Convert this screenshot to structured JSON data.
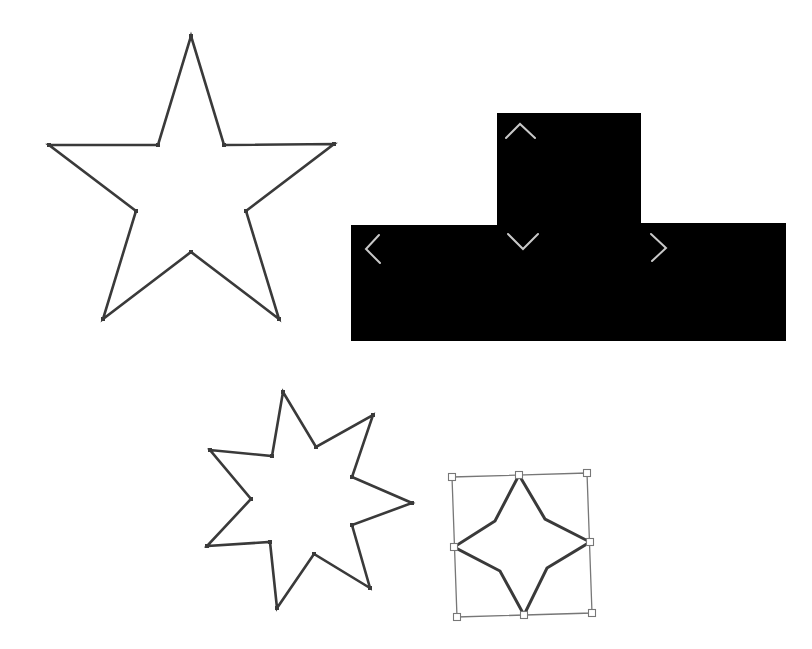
{
  "canvas": {
    "width": 812,
    "height": 649,
    "background": "#ffffff"
  },
  "colors": {
    "outline": "#3a3a3a",
    "fill_black": "#000000",
    "chevron": "#c8c8c8",
    "selection": "#777777"
  },
  "shapes": {
    "star5": {
      "label": "five-point-star",
      "points": [
        [
          191,
          36
        ],
        [
          224,
          145
        ],
        [
          334,
          144
        ],
        [
          246,
          211
        ],
        [
          279,
          319
        ],
        [
          191,
          252
        ],
        [
          103,
          319
        ],
        [
          136,
          211
        ],
        [
          49,
          145
        ],
        [
          158,
          145
        ]
      ]
    },
    "tshape": {
      "label": "black-t-shape",
      "points": [
        [
          497,
          113
        ],
        [
          641,
          113
        ],
        [
          641,
          223
        ],
        [
          786,
          223
        ],
        [
          786,
          341
        ],
        [
          351,
          341
        ],
        [
          351,
          225
        ],
        [
          497,
          225
        ]
      ],
      "chevrons": [
        {
          "name": "chevron-up-icon",
          "path": "M506,138 L520,124 L535,138"
        },
        {
          "name": "chevron-down-icon",
          "path": "M508,234 L523,249 L538,234"
        },
        {
          "name": "chevron-left-icon",
          "path": "M379,235 L366,249 L380,263"
        },
        {
          "name": "chevron-right-icon",
          "path": "M651,234 L666,248 L652,261"
        }
      ]
    },
    "star7": {
      "label": "seven-point-star",
      "points": [
        [
          283,
          392
        ],
        [
          316,
          447
        ],
        [
          373,
          415
        ],
        [
          352,
          477
        ],
        [
          412,
          503
        ],
        [
          352,
          525
        ],
        [
          370,
          588
        ],
        [
          314,
          554
        ],
        [
          277,
          608
        ],
        [
          270,
          542
        ],
        [
          207,
          546
        ],
        [
          251,
          499
        ],
        [
          210,
          450
        ],
        [
          272,
          456
        ]
      ]
    },
    "star4": {
      "label": "four-point-star-selected",
      "points": [
        [
          519,
          475
        ],
        [
          545,
          519
        ],
        [
          590,
          542
        ],
        [
          547,
          568
        ],
        [
          524,
          615
        ],
        [
          500,
          571
        ],
        [
          454,
          547
        ],
        [
          495,
          521
        ]
      ],
      "selection_box": [
        [
          452,
          477
        ],
        [
          587,
          473
        ],
        [
          592,
          613
        ],
        [
          457,
          617
        ]
      ],
      "handles": [
        [
          452,
          477
        ],
        [
          519,
          475
        ],
        [
          587,
          473
        ],
        [
          590,
          542
        ],
        [
          592,
          613
        ],
        [
          524,
          615
        ],
        [
          457,
          617
        ],
        [
          454,
          547
        ]
      ]
    }
  }
}
